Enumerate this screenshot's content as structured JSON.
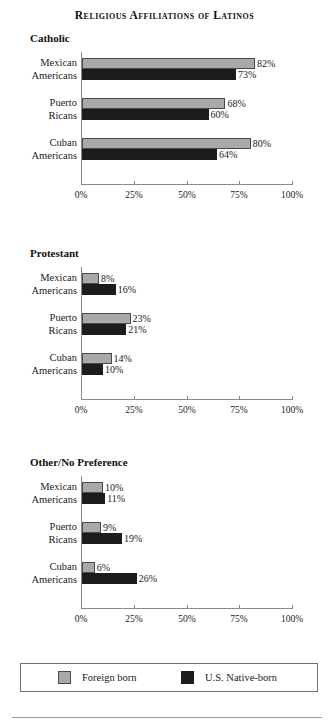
{
  "title": "Religious Affiliations of Latinos",
  "legend": {
    "items": [
      {
        "label": "Foreign born",
        "key": "foreign",
        "color": "#a9a9a9"
      },
      {
        "label": "U.S. Native-born",
        "key": "native",
        "color": "#1c1c1c"
      }
    ]
  },
  "axis": {
    "ticks": [
      "0%",
      "25%",
      "50%",
      "75%",
      "100%"
    ],
    "min": 0,
    "max": 100
  },
  "chart_data": {
    "type": "bar",
    "title": "Religious Affiliations of Latinos",
    "xlabel": "",
    "ylabel": "",
    "xlim": [
      0,
      100
    ],
    "grid": false,
    "legend_position": "bottom",
    "orientation": "horizontal",
    "tick_labels": [
      "0%",
      "25%",
      "50%",
      "75%",
      "100%"
    ],
    "categories": [
      "Mexican Americans",
      "Puerto Ricans",
      "Cuban Americans"
    ],
    "series_names": [
      "Foreign born",
      "U.S. Native-born"
    ],
    "panels": [
      {
        "title": "Catholic",
        "categories": [
          "Mexican Americans",
          "Puerto Ricans",
          "Cuban Americans"
        ],
        "series": [
          {
            "name": "Foreign born",
            "values": [
              82,
              68,
              80
            ],
            "labels": [
              "82%",
              "68%",
              "80%"
            ]
          },
          {
            "name": "U.S. Native-born",
            "values": [
              73,
              60,
              64
            ],
            "labels": [
              "73%",
              "60%",
              "64%"
            ]
          }
        ]
      },
      {
        "title": "Protestant",
        "categories": [
          "Mexican Americans",
          "Puerto Ricans",
          "Cuban Americans"
        ],
        "series": [
          {
            "name": "Foreign born",
            "values": [
              8,
              23,
              14
            ],
            "labels": [
              "8%",
              "23%",
              "14%"
            ]
          },
          {
            "name": "U.S. Native-born",
            "values": [
              16,
              21,
              10
            ],
            "labels": [
              "16%",
              "21%",
              "10%"
            ]
          }
        ]
      },
      {
        "title": "Other/No Preference",
        "categories": [
          "Mexican Americans",
          "Puerto Ricans",
          "Cuban Americans"
        ],
        "series": [
          {
            "name": "Foreign born",
            "values": [
              10,
              9,
              6
            ],
            "labels": [
              "10%",
              "9%",
              "6%"
            ]
          },
          {
            "name": "U.S. Native-born",
            "values": [
              11,
              19,
              26
            ],
            "labels": [
              "11%",
              "19%",
              "26%"
            ]
          }
        ]
      }
    ]
  },
  "category_lines": [
    [
      "Mexican",
      "Americans"
    ],
    [
      "Puerto",
      "Ricans"
    ],
    [
      "Cuban",
      "Americans"
    ]
  ],
  "panel_tops": [
    32,
    247,
    456
  ]
}
